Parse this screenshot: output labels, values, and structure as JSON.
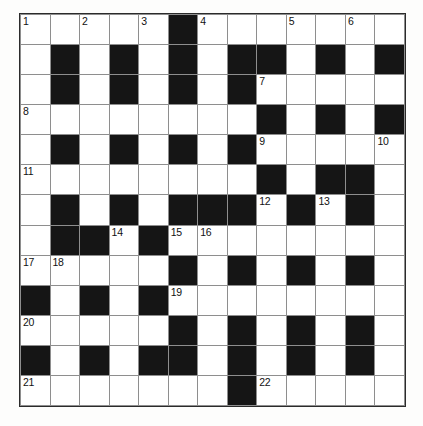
{
  "puzzle": {
    "kind": "crossword-grid",
    "rows": 13,
    "cols": 13,
    "colors": {
      "block": "#151515",
      "cell": "#ffffff",
      "gridline": "#8e8e8e",
      "border": "#2b2b2b",
      "number_text": "#111111",
      "page_background": "#fdfdfc"
    },
    "grid": [
      {
        "row": 0,
        "cells": [
          {
            "col": 0,
            "block": false,
            "number": "1"
          },
          {
            "col": 1,
            "block": false,
            "number": ""
          },
          {
            "col": 2,
            "block": false,
            "number": "2"
          },
          {
            "col": 3,
            "block": false,
            "number": ""
          },
          {
            "col": 4,
            "block": false,
            "number": "3"
          },
          {
            "col": 5,
            "block": true,
            "number": ""
          },
          {
            "col": 6,
            "block": false,
            "number": "4"
          },
          {
            "col": 7,
            "block": false,
            "number": ""
          },
          {
            "col": 8,
            "block": false,
            "number": ""
          },
          {
            "col": 9,
            "block": false,
            "number": "5"
          },
          {
            "col": 10,
            "block": false,
            "number": ""
          },
          {
            "col": 11,
            "block": false,
            "number": "6"
          },
          {
            "col": 12,
            "block": false,
            "number": ""
          }
        ]
      },
      {
        "row": 1,
        "cells": [
          {
            "col": 0,
            "block": false,
            "number": ""
          },
          {
            "col": 1,
            "block": true,
            "number": ""
          },
          {
            "col": 2,
            "block": false,
            "number": ""
          },
          {
            "col": 3,
            "block": true,
            "number": ""
          },
          {
            "col": 4,
            "block": false,
            "number": ""
          },
          {
            "col": 5,
            "block": true,
            "number": ""
          },
          {
            "col": 6,
            "block": false,
            "number": ""
          },
          {
            "col": 7,
            "block": true,
            "number": ""
          },
          {
            "col": 8,
            "block": true,
            "number": ""
          },
          {
            "col": 9,
            "block": false,
            "number": ""
          },
          {
            "col": 10,
            "block": true,
            "number": ""
          },
          {
            "col": 11,
            "block": false,
            "number": ""
          },
          {
            "col": 12,
            "block": true,
            "number": ""
          }
        ]
      },
      {
        "row": 2,
        "cells": [
          {
            "col": 0,
            "block": false,
            "number": ""
          },
          {
            "col": 1,
            "block": true,
            "number": ""
          },
          {
            "col": 2,
            "block": false,
            "number": ""
          },
          {
            "col": 3,
            "block": true,
            "number": ""
          },
          {
            "col": 4,
            "block": false,
            "number": ""
          },
          {
            "col": 5,
            "block": true,
            "number": ""
          },
          {
            "col": 6,
            "block": false,
            "number": ""
          },
          {
            "col": 7,
            "block": true,
            "number": ""
          },
          {
            "col": 8,
            "block": false,
            "number": "7"
          },
          {
            "col": 9,
            "block": false,
            "number": ""
          },
          {
            "col": 10,
            "block": false,
            "number": ""
          },
          {
            "col": 11,
            "block": false,
            "number": ""
          },
          {
            "col": 12,
            "block": false,
            "number": ""
          }
        ]
      },
      {
        "row": 3,
        "cells": [
          {
            "col": 0,
            "block": false,
            "number": "8"
          },
          {
            "col": 1,
            "block": false,
            "number": ""
          },
          {
            "col": 2,
            "block": false,
            "number": ""
          },
          {
            "col": 3,
            "block": false,
            "number": ""
          },
          {
            "col": 4,
            "block": false,
            "number": ""
          },
          {
            "col": 5,
            "block": false,
            "number": ""
          },
          {
            "col": 6,
            "block": false,
            "number": ""
          },
          {
            "col": 7,
            "block": false,
            "number": ""
          },
          {
            "col": 8,
            "block": true,
            "number": ""
          },
          {
            "col": 9,
            "block": false,
            "number": ""
          },
          {
            "col": 10,
            "block": true,
            "number": ""
          },
          {
            "col": 11,
            "block": false,
            "number": ""
          },
          {
            "col": 12,
            "block": true,
            "number": ""
          }
        ]
      },
      {
        "row": 4,
        "cells": [
          {
            "col": 0,
            "block": false,
            "number": ""
          },
          {
            "col": 1,
            "block": true,
            "number": ""
          },
          {
            "col": 2,
            "block": false,
            "number": ""
          },
          {
            "col": 3,
            "block": true,
            "number": ""
          },
          {
            "col": 4,
            "block": false,
            "number": ""
          },
          {
            "col": 5,
            "block": true,
            "number": ""
          },
          {
            "col": 6,
            "block": false,
            "number": ""
          },
          {
            "col": 7,
            "block": true,
            "number": ""
          },
          {
            "col": 8,
            "block": false,
            "number": "9"
          },
          {
            "col": 9,
            "block": false,
            "number": ""
          },
          {
            "col": 10,
            "block": false,
            "number": ""
          },
          {
            "col": 11,
            "block": false,
            "number": ""
          },
          {
            "col": 12,
            "block": false,
            "number": "10"
          }
        ]
      },
      {
        "row": 5,
        "cells": [
          {
            "col": 0,
            "block": false,
            "number": "11"
          },
          {
            "col": 1,
            "block": false,
            "number": ""
          },
          {
            "col": 2,
            "block": false,
            "number": ""
          },
          {
            "col": 3,
            "block": false,
            "number": ""
          },
          {
            "col": 4,
            "block": false,
            "number": ""
          },
          {
            "col": 5,
            "block": false,
            "number": ""
          },
          {
            "col": 6,
            "block": false,
            "number": ""
          },
          {
            "col": 7,
            "block": false,
            "number": ""
          },
          {
            "col": 8,
            "block": true,
            "number": ""
          },
          {
            "col": 9,
            "block": false,
            "number": ""
          },
          {
            "col": 10,
            "block": true,
            "number": ""
          },
          {
            "col": 11,
            "block": true,
            "number": ""
          },
          {
            "col": 12,
            "block": false,
            "number": ""
          }
        ]
      },
      {
        "row": 6,
        "cells": [
          {
            "col": 0,
            "block": false,
            "number": ""
          },
          {
            "col": 1,
            "block": true,
            "number": ""
          },
          {
            "col": 2,
            "block": false,
            "number": ""
          },
          {
            "col": 3,
            "block": true,
            "number": ""
          },
          {
            "col": 4,
            "block": false,
            "number": ""
          },
          {
            "col": 5,
            "block": true,
            "number": ""
          },
          {
            "col": 6,
            "block": true,
            "number": ""
          },
          {
            "col": 7,
            "block": true,
            "number": ""
          },
          {
            "col": 8,
            "block": false,
            "number": "12"
          },
          {
            "col": 9,
            "block": true,
            "number": ""
          },
          {
            "col": 10,
            "block": false,
            "number": "13"
          },
          {
            "col": 11,
            "block": true,
            "number": ""
          },
          {
            "col": 12,
            "block": false,
            "number": ""
          }
        ]
      },
      {
        "row": 7,
        "cells": [
          {
            "col": 0,
            "block": false,
            "number": ""
          },
          {
            "col": 1,
            "block": true,
            "number": ""
          },
          {
            "col": 2,
            "block": true,
            "number": ""
          },
          {
            "col": 3,
            "block": false,
            "number": "14"
          },
          {
            "col": 4,
            "block": true,
            "number": ""
          },
          {
            "col": 5,
            "block": false,
            "number": "15"
          },
          {
            "col": 6,
            "block": false,
            "number": "16"
          },
          {
            "col": 7,
            "block": false,
            "number": ""
          },
          {
            "col": 8,
            "block": false,
            "number": ""
          },
          {
            "col": 9,
            "block": false,
            "number": ""
          },
          {
            "col": 10,
            "block": false,
            "number": ""
          },
          {
            "col": 11,
            "block": false,
            "number": ""
          },
          {
            "col": 12,
            "block": false,
            "number": ""
          }
        ]
      },
      {
        "row": 8,
        "cells": [
          {
            "col": 0,
            "block": false,
            "number": "17"
          },
          {
            "col": 1,
            "block": false,
            "number": "18"
          },
          {
            "col": 2,
            "block": false,
            "number": ""
          },
          {
            "col": 3,
            "block": false,
            "number": ""
          },
          {
            "col": 4,
            "block": false,
            "number": ""
          },
          {
            "col": 5,
            "block": true,
            "number": ""
          },
          {
            "col": 6,
            "block": false,
            "number": ""
          },
          {
            "col": 7,
            "block": true,
            "number": ""
          },
          {
            "col": 8,
            "block": false,
            "number": ""
          },
          {
            "col": 9,
            "block": true,
            "number": ""
          },
          {
            "col": 10,
            "block": false,
            "number": ""
          },
          {
            "col": 11,
            "block": true,
            "number": ""
          },
          {
            "col": 12,
            "block": false,
            "number": ""
          }
        ]
      },
      {
        "row": 9,
        "cells": [
          {
            "col": 0,
            "block": true,
            "number": ""
          },
          {
            "col": 1,
            "block": false,
            "number": ""
          },
          {
            "col": 2,
            "block": true,
            "number": ""
          },
          {
            "col": 3,
            "block": false,
            "number": ""
          },
          {
            "col": 4,
            "block": true,
            "number": ""
          },
          {
            "col": 5,
            "block": false,
            "number": "19"
          },
          {
            "col": 6,
            "block": false,
            "number": ""
          },
          {
            "col": 7,
            "block": false,
            "number": ""
          },
          {
            "col": 8,
            "block": false,
            "number": ""
          },
          {
            "col": 9,
            "block": false,
            "number": ""
          },
          {
            "col": 10,
            "block": false,
            "number": ""
          },
          {
            "col": 11,
            "block": false,
            "number": ""
          },
          {
            "col": 12,
            "block": false,
            "number": ""
          }
        ]
      },
      {
        "row": 10,
        "cells": [
          {
            "col": 0,
            "block": false,
            "number": "20"
          },
          {
            "col": 1,
            "block": false,
            "number": ""
          },
          {
            "col": 2,
            "block": false,
            "number": ""
          },
          {
            "col": 3,
            "block": false,
            "number": ""
          },
          {
            "col": 4,
            "block": false,
            "number": ""
          },
          {
            "col": 5,
            "block": true,
            "number": ""
          },
          {
            "col": 6,
            "block": false,
            "number": ""
          },
          {
            "col": 7,
            "block": true,
            "number": ""
          },
          {
            "col": 8,
            "block": false,
            "number": ""
          },
          {
            "col": 9,
            "block": true,
            "number": ""
          },
          {
            "col": 10,
            "block": false,
            "number": ""
          },
          {
            "col": 11,
            "block": true,
            "number": ""
          },
          {
            "col": 12,
            "block": false,
            "number": ""
          }
        ]
      },
      {
        "row": 11,
        "cells": [
          {
            "col": 0,
            "block": true,
            "number": ""
          },
          {
            "col": 1,
            "block": false,
            "number": ""
          },
          {
            "col": 2,
            "block": true,
            "number": ""
          },
          {
            "col": 3,
            "block": false,
            "number": ""
          },
          {
            "col": 4,
            "block": true,
            "number": ""
          },
          {
            "col": 5,
            "block": true,
            "number": ""
          },
          {
            "col": 6,
            "block": false,
            "number": ""
          },
          {
            "col": 7,
            "block": true,
            "number": ""
          },
          {
            "col": 8,
            "block": false,
            "number": ""
          },
          {
            "col": 9,
            "block": true,
            "number": ""
          },
          {
            "col": 10,
            "block": false,
            "number": ""
          },
          {
            "col": 11,
            "block": true,
            "number": ""
          },
          {
            "col": 12,
            "block": false,
            "number": ""
          }
        ]
      },
      {
        "row": 12,
        "cells": [
          {
            "col": 0,
            "block": false,
            "number": "21"
          },
          {
            "col": 1,
            "block": false,
            "number": ""
          },
          {
            "col": 2,
            "block": false,
            "number": ""
          },
          {
            "col": 3,
            "block": false,
            "number": ""
          },
          {
            "col": 4,
            "block": false,
            "number": ""
          },
          {
            "col": 5,
            "block": false,
            "number": ""
          },
          {
            "col": 6,
            "block": false,
            "number": ""
          },
          {
            "col": 7,
            "block": true,
            "number": ""
          },
          {
            "col": 8,
            "block": false,
            "number": "22"
          },
          {
            "col": 9,
            "block": false,
            "number": ""
          },
          {
            "col": 10,
            "block": false,
            "number": ""
          },
          {
            "col": 11,
            "block": false,
            "number": ""
          },
          {
            "col": 12,
            "block": false,
            "number": ""
          }
        ]
      }
    ]
  }
}
